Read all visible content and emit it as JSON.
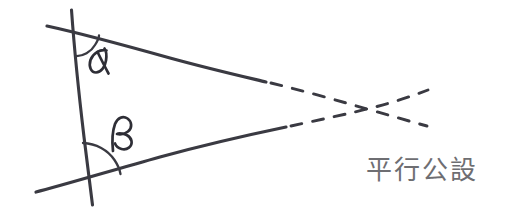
{
  "diagram": {
    "title": "平行公設",
    "caption": "平行公設",
    "stroke_color": "#3a3a42",
    "caption_color": "#6e6e72",
    "background_color": "#ffffff",
    "style": "hand-drawn pencil sketch",
    "angles": [
      {
        "id": "alpha",
        "symbol": "α",
        "label": "α",
        "position": "upper interior angle",
        "arc": "small"
      },
      {
        "id": "beta",
        "symbol": "β",
        "label": "β",
        "position": "lower interior angle",
        "arc": "large"
      }
    ],
    "elements": [
      {
        "name": "transversal-line",
        "type": "solid",
        "description": "near-vertical transversal crossing both rays"
      },
      {
        "name": "upper-ray-solid",
        "type": "solid",
        "description": "upper ray going right and slightly down"
      },
      {
        "name": "lower-ray-solid",
        "type": "solid",
        "description": "lower ray going right and slightly up"
      },
      {
        "name": "upper-ray-dashed",
        "type": "dashed",
        "description": "dashed extension of upper ray past intersection"
      },
      {
        "name": "lower-ray-dashed",
        "type": "dashed",
        "description": "dashed extension of lower ray past intersection"
      }
    ],
    "intersection_note": "the two dashed extensions meet and cross on the right"
  }
}
